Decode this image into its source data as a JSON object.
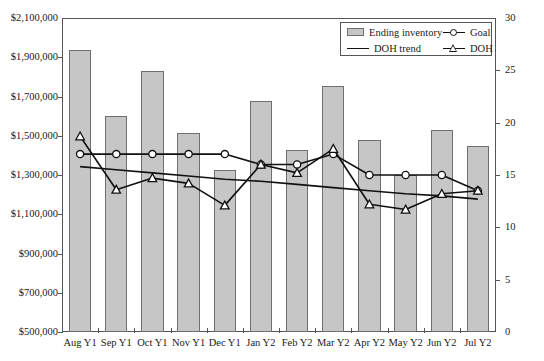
{
  "chart_data": {
    "type": "bar",
    "title": "",
    "xlabel": "",
    "ylabel": "",
    "y2label": "",
    "grid": false,
    "legend_position": "top-right",
    "categories": [
      "Aug Y1",
      "Sep Y1",
      "Oct Y1",
      "Nov Y1",
      "Dec Y1",
      "Jan Y2",
      "Feb Y2",
      "Mar Y2",
      "Apr Y2",
      "May Y2",
      "Jun Y2",
      "Jul Y2"
    ],
    "ylim": [
      500000,
      2100000
    ],
    "ytick_step": 200000,
    "ytick_labels": [
      "$2,100,000",
      "$1,900,000",
      "$1,700,000",
      "$1,500,000",
      "$1,300,000",
      "$1,100,000",
      "$900,000",
      "$700,000",
      "$500,000"
    ],
    "y2lim": [
      0,
      30
    ],
    "y2tick_step": 5,
    "y2tick_labels": [
      "30",
      "25",
      "20",
      "15",
      "10",
      "5",
      "0"
    ],
    "series": [
      {
        "name": "Ending inventory",
        "axis": "left",
        "type": "bar",
        "color": "#c6c6c6",
        "values": [
          1935000,
          1600000,
          1830000,
          1515000,
          1325000,
          1675000,
          1425000,
          1755000,
          1480000,
          1300000,
          1530000,
          1450000
        ]
      },
      {
        "name": "Goal",
        "axis": "right",
        "type": "line",
        "marker": "circle",
        "color": "#111111",
        "values": [
          17.0,
          17.0,
          17.0,
          17.0,
          17.0,
          16.0,
          16.0,
          17.0,
          15.0,
          15.0,
          15.0,
          13.5
        ]
      },
      {
        "name": "DOH trend",
        "axis": "right",
        "type": "line",
        "marker": "none",
        "color": "#111111",
        "values": [
          15.8,
          15.5,
          15.2,
          14.9,
          14.6,
          14.4,
          14.1,
          13.8,
          13.5,
          13.2,
          13.0,
          12.7
        ]
      },
      {
        "name": "DOH",
        "axis": "right",
        "type": "line",
        "marker": "triangle",
        "color": "#111111",
        "values": [
          18.7,
          13.6,
          14.7,
          14.2,
          12.1,
          16.0,
          15.2,
          17.5,
          12.2,
          11.7,
          13.2,
          13.5
        ]
      }
    ]
  },
  "legend": {
    "entries": [
      {
        "label": "Ending inventory",
        "glyph": "bar-swatch"
      },
      {
        "label": "Goal",
        "glyph": "line-circle-marker"
      },
      {
        "label": "DOH trend",
        "glyph": "plain-line"
      },
      {
        "label": "DOH",
        "glyph": "line-triangle-marker"
      }
    ]
  }
}
